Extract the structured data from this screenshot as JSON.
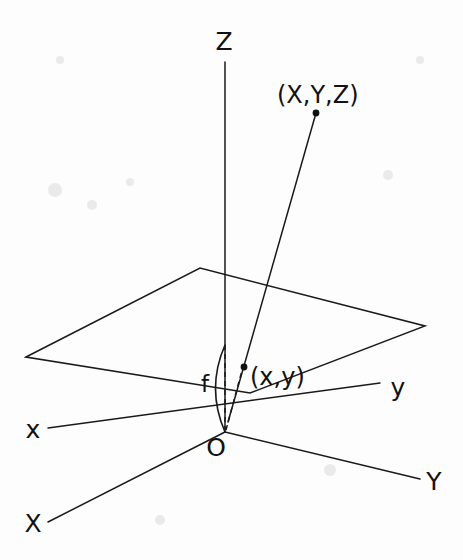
{
  "figure": {
    "background_color": "#fdfdfd",
    "ink_color": "#1a1a1a"
  },
  "chart_data": {
    "type": "diagram",
    "axes": [
      {
        "id": "axis-Z",
        "label": "Z",
        "kind": "camera-optical-axis",
        "from": [
          225,
          432
        ],
        "to": [
          225,
          62
        ],
        "label_pos": [
          224,
          50
        ]
      },
      {
        "id": "axis-x-lower",
        "label": "x",
        "kind": "image-plane-axis",
        "from": [
          380,
          383
        ],
        "to": [
          48,
          428
        ],
        "label_pos": [
          33,
          438
        ]
      },
      {
        "id": "axis-y-lower",
        "label": "y",
        "kind": "image-plane-axis",
        "from": [
          48,
          428
        ],
        "to": [
          380,
          383
        ],
        "label_pos": [
          398,
          396
        ]
      },
      {
        "id": "axis-X-upper",
        "label": "X",
        "kind": "world-axis",
        "from": [
          225,
          432
        ],
        "to": [
          48,
          522
        ],
        "label_pos": [
          33,
          532
        ]
      },
      {
        "id": "axis-Y-upper",
        "label": "Y",
        "kind": "world-axis",
        "from": [
          225,
          432
        ],
        "to": [
          420,
          479
        ],
        "label_pos": [
          434,
          490
        ]
      }
    ],
    "image_plane": {
      "id": "image-plane",
      "shape": "parallelogram",
      "corners": [
        [
          26,
          357
        ],
        [
          200,
          268
        ],
        [
          425,
          326
        ],
        [
          250,
          393
        ]
      ]
    },
    "points": [
      {
        "id": "world-point",
        "label": "(X,Y,Z)",
        "pos": [
          316,
          113
        ],
        "label_pos": [
          277,
          103
        ],
        "dot_radius": 3.4
      },
      {
        "id": "image-point",
        "label": "(x,y)",
        "pos": [
          244,
          367
        ],
        "label_pos": [
          250,
          385
        ],
        "dot_radius": 3.4
      },
      {
        "id": "origin",
        "label": "O",
        "pos": [
          225,
          432
        ],
        "label_pos": [
          216,
          456
        ],
        "dot_radius": 0
      }
    ],
    "rays": [
      {
        "id": "projection-ray",
        "from": [
          225,
          432
        ],
        "to": [
          316,
          113
        ],
        "style": "solid",
        "through": [
          244,
          367
        ]
      },
      {
        "id": "focal-dashed-axis",
        "from": [
          225,
          345
        ],
        "to": [
          225,
          432
        ],
        "style": "dashed"
      },
      {
        "id": "image-point-dashed",
        "from": [
          225,
          432
        ],
        "to": [
          244,
          363
        ],
        "style": "dashed"
      }
    ],
    "focal_length": {
      "id": "focal-length-arc",
      "label": "f",
      "label_pos": [
        205,
        392
      ],
      "arc_from": [
        225,
        345
      ],
      "arc_to": [
        225,
        432
      ],
      "arc_bulge_x": 206
    },
    "legend": [],
    "grid": false
  },
  "labels": {
    "z_axis": "Z",
    "x_axis_lower": "x",
    "y_axis_lower": "y",
    "x_axis_upper": "X",
    "y_axis_upper": "Y",
    "world_point": "(X,Y,Z)",
    "image_point": "(x,y)",
    "origin": "O",
    "focal_length": "f"
  }
}
